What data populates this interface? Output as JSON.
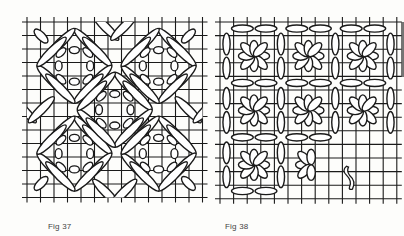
{
  "figures": [
    {
      "id": "fig37",
      "caption": "Fig 37",
      "description": "Needlepoint diagram: diagonal straight-stitch diamond (Florentine/cushion) pattern on canvas grid",
      "grid": {
        "x0": 27,
        "y0": 22,
        "cell": 13.5,
        "cols": 13,
        "rows": 13
      }
    },
    {
      "id": "fig38",
      "caption": "Fig 38",
      "description": "Needlepoint diagram: eight-petal flower (Rhodes/daisy) stitch blocks bordered by straight stitches, partially worked, with loose thread end",
      "grid": {
        "x0": 220,
        "y0": 22,
        "cell": 13.6,
        "cols": 13,
        "rows": 13
      },
      "flowers_worked": 8,
      "thread_end_visible": true
    }
  ],
  "colors": {
    "ink": "#1a1a1a",
    "paper": "#fdfdfb",
    "caption": "#444444",
    "edge_shadow": "#3a3a3a"
  }
}
